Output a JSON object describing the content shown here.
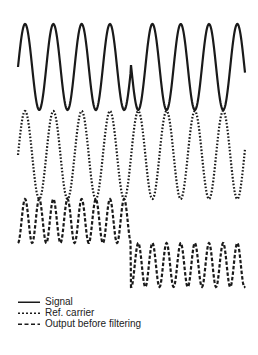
{
  "chart_data": {
    "type": "line",
    "title": "",
    "xlabel": "",
    "ylabel": "",
    "grid": false,
    "legend_position": "bottom-left",
    "series": [
      {
        "name": "Signal",
        "style": "solid",
        "description": "Sinusoid, 8 cycles, with a 180-degree phase inversion at the midpoint (x ≈ 0.5)",
        "x_range": [
          18,
          245
        ],
        "center_y": 67,
        "amplitude": 43,
        "period": 28.3,
        "phase_jump_x": 131
      },
      {
        "name": "Ref. carrier",
        "style": "dotted",
        "description": "Continuous reference sinusoid at carrier frequency, no phase jump",
        "x_range": [
          18,
          245
        ],
        "center_y": 155,
        "amplitude": 44,
        "period": 28.3
      },
      {
        "name": "Output before filtering",
        "style": "dashed",
        "description": "Product of signal and carrier: double-frequency ripple offset positive before the phase jump, offset negative after",
        "x_range": [
          18,
          245
        ],
        "segments": [
          {
            "x_range": [
              18,
              131
            ],
            "center_y": 221,
            "amplitude": 22,
            "period": 14.15
          },
          {
            "x_range": [
              131,
              245
            ],
            "center_y": 265,
            "amplitude": 22,
            "period": 14.15
          }
        ]
      }
    ]
  },
  "legend": {
    "items": [
      {
        "label": "Signal",
        "style": "solid"
      },
      {
        "label": "Ref. carrier",
        "style": "dotted"
      },
      {
        "label": "Output before filtering",
        "style": "dashed"
      }
    ]
  },
  "colors": {
    "line": "#1a1a1a",
    "background": "#ffffff"
  }
}
